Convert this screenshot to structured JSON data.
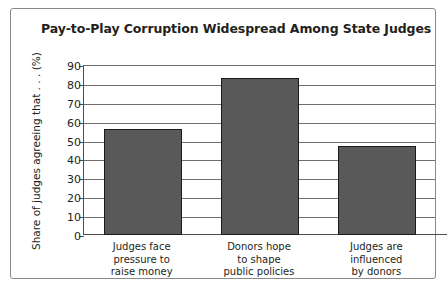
{
  "chart_data": {
    "type": "bar",
    "title": "Pay-to-Play Corruption Widespread Among State Judges",
    "xlabel": "",
    "ylabel": "Share of judges agreeing that . . . (%)",
    "ylim": [
      0,
      90
    ],
    "ytick_labels": [
      "0",
      "10",
      "20",
      "30",
      "40",
      "50",
      "60",
      "70",
      "80",
      "90"
    ],
    "ytick_values": [
      0,
      10,
      20,
      30,
      40,
      50,
      60,
      70,
      80,
      90
    ],
    "grid": true,
    "legend": "none",
    "categories": [
      "Judges face\npressure to\nraise money",
      "Donors hope\nto shape\npublic policies",
      "Judges are\ninfluenced\nby donors"
    ],
    "values": [
      56,
      83,
      47
    ],
    "bar_color": "#595959",
    "bar_edge_color": "#1a1a1a",
    "axis_color": "#4d4d4d",
    "grid_color": "#6e6e6e",
    "text_color": "#231f20",
    "frame_color": "#8a8a8a",
    "background": "#ffffff"
  }
}
